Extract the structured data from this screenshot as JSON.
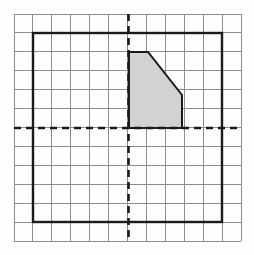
{
  "figure": {
    "canvas": {
      "width": 254,
      "height": 255,
      "background": "#fdfdfd"
    },
    "grid": {
      "label": "square-grid",
      "origin_px": {
        "x": 14,
        "y": 14
      },
      "cell_size_px": 18.92,
      "columns": 12,
      "rows": 12,
      "extent_px": {
        "x0": 14,
        "y0": 14,
        "x1": 241,
        "y1": 241
      },
      "line_color": "#8d8d8d",
      "line_width": 1,
      "show": true
    },
    "axes": {
      "label": "dashed-coordinate-axes",
      "style": "dashed",
      "color": "#1a1a1a",
      "line_width": 2.6,
      "dash_pattern": "7,5",
      "x_axis": {
        "name": "horizontal-axis",
        "y_px": 128,
        "x0_px": 14,
        "x1_px": 241
      },
      "y_axis": {
        "name": "vertical-axis",
        "x_px": 128.5,
        "y0_px": 14,
        "y1_px": 241
      },
      "origin_px": {
        "x": 128.5,
        "y": 128
      },
      "origin_cell": {
        "col": 6,
        "row": 6
      }
    },
    "bold_square": {
      "label": "heavy-bounding-square",
      "x0_px": 33,
      "y0_px": 33,
      "x1_px": 222,
      "y1_px": 222,
      "side_cells": 10,
      "stroke": "#1a1a1a",
      "stroke_width": 2.4,
      "fill": "none"
    },
    "shaded_shape": {
      "label": "shaded-pentagon",
      "fill": "#d2d2d2",
      "stroke": "#1a1a1a",
      "stroke_width": 2.0,
      "vertices_px": [
        {
          "x": 129,
          "y": 52
        },
        {
          "x": 148,
          "y": 52
        },
        {
          "x": 182,
          "y": 95
        },
        {
          "x": 182,
          "y": 128
        },
        {
          "x": 129,
          "y": 128
        }
      ],
      "vertices_grid": [
        {
          "x": 0,
          "y": 4
        },
        {
          "x": 1,
          "y": 4
        },
        {
          "x": 3,
          "y": 1.75
        },
        {
          "x": 3,
          "y": 0
        },
        {
          "x": 0,
          "y": 0
        }
      ],
      "edge_count": 5,
      "description": "pentagon in first quadrant with slanted upper-right edge"
    }
  },
  "chart_data": {
    "type": "scatter",
    "title": "",
    "xlabel": "",
    "ylabel": "",
    "xlim": [
      -6,
      6
    ],
    "ylim": [
      -6,
      6
    ],
    "grid": true,
    "legend": "none",
    "annotations": [
      "dashed x-axis through middle row",
      "dashed y-axis through middle column",
      "bold square spanning 10 by 10 cells",
      "gray-filled pentagon anchored at origin"
    ],
    "series": [
      {
        "name": "shaded-pentagon",
        "kind": "polygon",
        "x": [
          0,
          1,
          3,
          3,
          0
        ],
        "y": [
          4,
          4,
          1.75,
          0,
          0
        ]
      },
      {
        "name": "bold-square",
        "kind": "polygon",
        "x": [
          -5,
          5,
          5,
          -5
        ],
        "y": [
          5,
          5,
          -5,
          -5
        ]
      }
    ]
  }
}
